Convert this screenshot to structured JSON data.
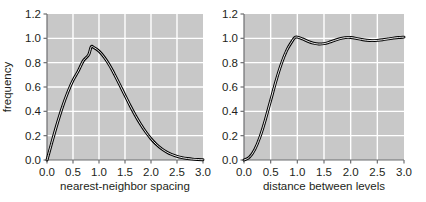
{
  "figure": {
    "background": "#ffffff",
    "panel_background": "#c8c8c8",
    "gridline_color": "#ffffff",
    "curve_color": "#000000",
    "curve_fill": "#ffffff",
    "axis_color": "#6d6e71"
  },
  "chart_data": [
    {
      "type": "line",
      "panel": "left",
      "title": "",
      "xlabel": "nearest-neighbor spacing",
      "ylabel": "frequency",
      "xlim": [
        0.0,
        3.0
      ],
      "ylim": [
        0.0,
        1.2
      ],
      "xticks": [
        0.0,
        0.5,
        1.0,
        1.5,
        2.0,
        2.5,
        3.0
      ],
      "xticklabels": [
        "0.0",
        "0.5",
        "1.0",
        "1.5",
        "2.0",
        "2.5",
        "3.0"
      ],
      "yticks": [
        0.0,
        0.2,
        0.4,
        0.6,
        0.8,
        1.0,
        1.2
      ],
      "yticklabels": [
        "0.0",
        "0.2",
        "0.4",
        "0.6",
        "0.8",
        "1.0",
        "1.2"
      ],
      "grid": true,
      "legend": "none",
      "series": [
        {
          "name": "Wigner surmise (GOE nearest-neighbor spacing)",
          "x": [
            0.0,
            0.1,
            0.2,
            0.3,
            0.4,
            0.5,
            0.6,
            0.7,
            0.8,
            0.85,
            0.9,
            1.0,
            1.1,
            1.2,
            1.3,
            1.4,
            1.5,
            1.6,
            1.7,
            1.8,
            1.9,
            2.0,
            2.1,
            2.2,
            2.3,
            2.4,
            2.5,
            2.6,
            2.7,
            2.8,
            2.9,
            3.0
          ],
          "y": [
            0.0,
            0.155,
            0.304,
            0.44,
            0.557,
            0.655,
            0.73,
            0.817,
            0.864,
            0.93,
            0.925,
            0.895,
            0.845,
            0.78,
            0.702,
            0.618,
            0.531,
            0.446,
            0.366,
            0.294,
            0.23,
            0.175,
            0.13,
            0.094,
            0.066,
            0.045,
            0.03,
            0.019,
            0.012,
            0.007,
            0.004,
            0.002
          ]
        }
      ]
    },
    {
      "type": "line",
      "panel": "right",
      "title": "",
      "xlabel": "distance between levels",
      "ylabel": "",
      "xlim": [
        0.0,
        3.0
      ],
      "ylim": [
        0.0,
        1.2
      ],
      "xticks": [
        0.0,
        0.5,
        1.0,
        1.5,
        2.0,
        2.5,
        3.0
      ],
      "xticklabels": [
        "0.0",
        "0.5",
        "1.0",
        "1.5",
        "2.0",
        "2.5",
        "3.0"
      ],
      "yticks": [
        0.0,
        0.2,
        0.4,
        0.6,
        0.8,
        1.0,
        1.2
      ],
      "yticklabels": [
        "0.0",
        "0.2",
        "0.4",
        "0.6",
        "0.8",
        "1.0",
        "1.2"
      ],
      "grid": true,
      "legend": "none",
      "series": [
        {
          "name": "two-level correlation function",
          "x": [
            0.0,
            0.1,
            0.2,
            0.3,
            0.4,
            0.5,
            0.6,
            0.7,
            0.8,
            0.9,
            0.95,
            1.0,
            1.1,
            1.2,
            1.3,
            1.4,
            1.5,
            1.6,
            1.7,
            1.8,
            1.9,
            1.95,
            2.0,
            2.1,
            2.2,
            2.3,
            2.4,
            2.5,
            2.6,
            2.7,
            2.8,
            2.9,
            3.0
          ],
          "y": [
            0.0,
            0.022,
            0.085,
            0.19,
            0.33,
            0.49,
            0.65,
            0.79,
            0.9,
            0.975,
            1.005,
            1.01,
            0.995,
            0.975,
            0.96,
            0.953,
            0.956,
            0.968,
            0.983,
            0.997,
            1.006,
            1.008,
            1.007,
            1.0,
            0.991,
            0.984,
            0.981,
            0.983,
            0.988,
            0.995,
            1.002,
            1.007,
            1.01
          ]
        }
      ]
    }
  ],
  "panels": {
    "left": {
      "name": "nearest-neighbor-spacing-plot",
      "ylabel": "frequency",
      "xlabel": "nearest-neighbor spacing"
    },
    "right": {
      "name": "distance-between-levels-plot",
      "ylabel": "",
      "xlabel": "distance between levels"
    }
  }
}
